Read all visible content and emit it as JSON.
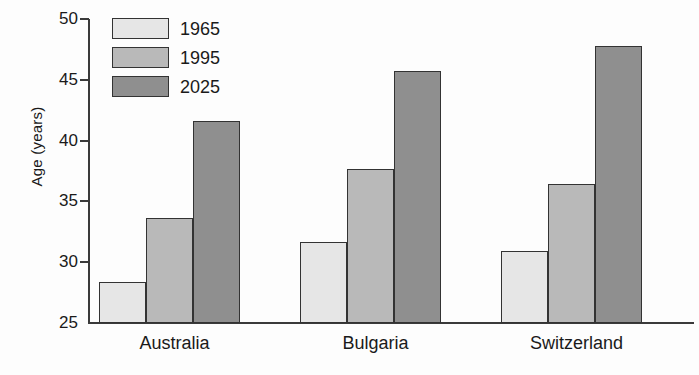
{
  "chart_data": {
    "type": "bar",
    "title": "",
    "subtitle": "",
    "xlabel": "",
    "ylabel": "Age (years)",
    "categories": [
      "Australia",
      "Bulgaria",
      "Switzerland"
    ],
    "series": [
      {
        "name": "1965",
        "values": [
          28.4,
          31.7,
          30.9
        ],
        "color": "#e6e6e6"
      },
      {
        "name": "1995",
        "values": [
          33.6,
          37.7,
          36.4
        ],
        "color": "#b9b9b9"
      },
      {
        "name": "2025",
        "values": [
          41.6,
          45.7,
          47.8
        ],
        "color": "#8f8f8f"
      }
    ],
    "ylim": [
      25,
      50
    ],
    "yticks": [
      25,
      30,
      35,
      40,
      45,
      50
    ],
    "ytick_labels": [
      "25",
      "30",
      "35",
      "40",
      "45",
      "50"
    ],
    "grid": false,
    "legend_position": "top-left",
    "axis_color": "#3a3a3a",
    "bar_edge_color": "#333333",
    "background_color": "#fdfdfd"
  },
  "axis": {
    "y_title": "Age (years)"
  },
  "legend": {
    "entries": [
      {
        "label": "1965"
      },
      {
        "label": "1995"
      },
      {
        "label": "2025"
      }
    ]
  },
  "categories": [
    {
      "label": "Australia"
    },
    {
      "label": "Bulgaria"
    },
    {
      "label": "Switzerland"
    }
  ],
  "yticks": [
    {
      "label": "50"
    },
    {
      "label": "45"
    },
    {
      "label": "40"
    },
    {
      "label": "35"
    },
    {
      "label": "30"
    },
    {
      "label": "25"
    }
  ]
}
